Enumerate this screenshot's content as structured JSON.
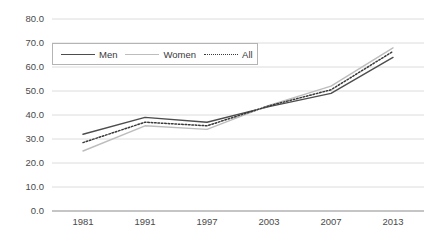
{
  "chart_data": {
    "type": "line",
    "title": "",
    "subtitle": "",
    "xlabel": "",
    "ylabel": "",
    "categories": [
      "1981",
      "1991",
      "1997",
      "2003",
      "2007",
      "2013"
    ],
    "x_tick_labels": [
      "1981",
      "1991",
      "1997",
      "2003",
      "2007",
      "2013"
    ],
    "y_tick_labels": [
      "0.0",
      "10.0",
      "20.0",
      "30.0",
      "40.0",
      "50.0",
      "60.0",
      "70.0",
      "80.0"
    ],
    "ylim": [
      0,
      80
    ],
    "y_tick_step": 10,
    "grid": true,
    "grid_axis": "y",
    "legend_position": "top-left-inside",
    "series": [
      {
        "name": "Men",
        "style": "solid",
        "color": "#4d4d4d",
        "values": [
          32.0,
          39.0,
          37.0,
          43.5,
          49.0,
          64.0
        ]
      },
      {
        "name": "Women",
        "style": "solid",
        "color": "#bdbdbd",
        "values": [
          25.0,
          35.5,
          34.0,
          44.0,
          52.0,
          68.0
        ]
      },
      {
        "name": "All",
        "style": "dotted",
        "color": "#3a3a3a",
        "values": [
          28.5,
          37.0,
          35.5,
          43.8,
          50.5,
          66.5
        ]
      }
    ],
    "legend": [
      {
        "label": "Men",
        "icon": "line-solid-dark-icon"
      },
      {
        "label": "Women",
        "icon": "line-solid-light-icon"
      },
      {
        "label": "All",
        "icon": "line-dotted-icon"
      }
    ],
    "colors": {
      "men": "#4d4d4d",
      "women": "#bdbdbd",
      "all": "#3a3a3a",
      "grid": "#dcdcdc",
      "axis": "#8c8c8c",
      "tick_text": "#4a4a4a",
      "legend_border": "#b4b4b4",
      "background": "#ffffff"
    }
  }
}
